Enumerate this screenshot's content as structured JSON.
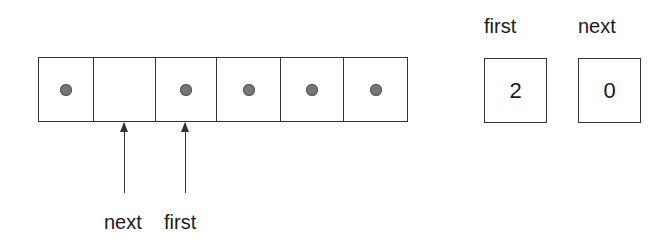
{
  "diagram": {
    "array": {
      "cells": [
        {
          "index": 0,
          "occupied": true
        },
        {
          "index": 1,
          "occupied": false
        },
        {
          "index": 2,
          "occupied": true
        },
        {
          "index": 3,
          "occupied": true
        },
        {
          "index": 4,
          "occupied": true
        },
        {
          "index": 5,
          "occupied": true
        }
      ],
      "cell_widths": [
        55,
        62,
        61,
        64,
        63,
        63
      ]
    },
    "pointers": [
      {
        "label": "next",
        "points_to_cell": 1
      },
      {
        "label": "first",
        "points_to_cell": 2
      }
    ],
    "variables": [
      {
        "name": "first",
        "value": "2"
      },
      {
        "name": "next",
        "value": "0"
      }
    ],
    "colors": {
      "line": "#333333",
      "dot": "#777777",
      "background": "#ffffff"
    }
  }
}
